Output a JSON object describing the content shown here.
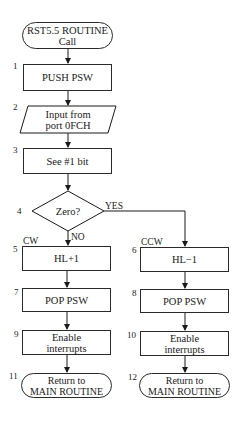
{
  "diagram": {
    "start": {
      "label": "RST5.5 ROUTINE\nCall"
    },
    "steps": [
      {
        "num": "1",
        "label": "PUSH PSW"
      },
      {
        "num": "2",
        "label": "Input from\nport 0FCH"
      },
      {
        "num": "3",
        "label": "See #1 bit"
      },
      {
        "num": "4",
        "label": "Zero?"
      },
      {
        "num": "5",
        "label": "HL+1"
      },
      {
        "num": "6",
        "label": "HL−1"
      },
      {
        "num": "7",
        "label": "POP  PSW"
      },
      {
        "num": "8",
        "label": "POP PSW"
      },
      {
        "num": "9",
        "label": "Enable\ninterrupts"
      },
      {
        "num": "10",
        "label": "Enable\ninterrupts"
      },
      {
        "num": "11",
        "label": "Return to\nMAIN ROUTINE"
      },
      {
        "num": "12",
        "label": "Return to\nMAIN ROUTINE"
      }
    ],
    "branches": {
      "yes": "YES",
      "no": "NO",
      "left": "CW",
      "right": "CCW"
    }
  }
}
